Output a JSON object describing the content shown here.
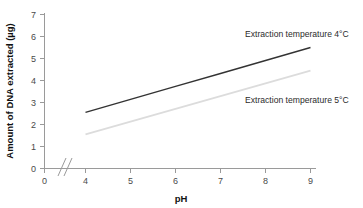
{
  "chart_data": {
    "type": "line",
    "title": "",
    "xlabel": "pH",
    "ylabel": "Amount of DNA extracted (µg)",
    "xlim": [
      4,
      9
    ],
    "ylim": [
      0,
      7
    ],
    "xticks": [
      "0",
      "4",
      "5",
      "6",
      "7",
      "8",
      "9"
    ],
    "yticks": [
      "0",
      "1",
      "2",
      "3",
      "4",
      "5",
      "6",
      "7"
    ],
    "grid": false,
    "axis_break": {
      "axis": "x",
      "between": [
        0,
        4
      ],
      "symbol": "//"
    },
    "legend_position": "inline-right",
    "series": [
      {
        "name": "Extraction temperature  4°C",
        "color": "#333333",
        "x": [
          4,
          5,
          6,
          7,
          8,
          9
        ],
        "values": [
          2.55,
          3.14,
          3.73,
          4.32,
          4.91,
          5.5
        ]
      },
      {
        "name": "Extraction temperature  5°C",
        "color": "#dcdcdc",
        "x": [
          4,
          5,
          6,
          7,
          8,
          9
        ],
        "values": [
          1.55,
          2.13,
          2.71,
          3.29,
          3.87,
          4.45
        ]
      }
    ]
  },
  "labels": {
    "y_axis_title": "Amount of DNA extracted (µg)",
    "x_axis_title": "pH",
    "series_1": "Extraction temperature  4°C",
    "series_2": "Extraction temperature  5°C",
    "y_tick_7": "7",
    "y_tick_6": "6",
    "y_tick_5": "5",
    "y_tick_4": "4",
    "y_tick_3": "3",
    "y_tick_2": "2",
    "y_tick_1": "1",
    "y_tick_0": "0",
    "x_tick_0": "0",
    "x_tick_4": "4",
    "x_tick_5": "5",
    "x_tick_6": "6",
    "x_tick_7": "7",
    "x_tick_8": "8",
    "x_tick_9": "9"
  },
  "colors": {
    "axis": "#9a9a9a",
    "series_dark": "#333333",
    "series_light": "#dcdcdc",
    "text": "#4a4a4a",
    "background": "#ffffff"
  }
}
